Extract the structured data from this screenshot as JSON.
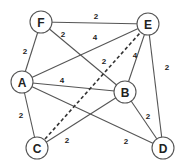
{
  "graph": {
    "nodes": [
      {
        "id": "F",
        "label": "F",
        "x": 41,
        "y": 22
      },
      {
        "id": "E",
        "label": "E",
        "x": 148,
        "y": 24
      },
      {
        "id": "A",
        "label": "A",
        "x": 22,
        "y": 82
      },
      {
        "id": "B",
        "label": "B",
        "x": 125,
        "y": 92
      },
      {
        "id": "C",
        "label": "C",
        "x": 37,
        "y": 148
      },
      {
        "id": "D",
        "label": "D",
        "x": 163,
        "y": 148
      }
    ],
    "edges": [
      {
        "from": "F",
        "to": "E",
        "weight": "2",
        "dashed": false,
        "lx": 96,
        "ly": 16
      },
      {
        "from": "F",
        "to": "A",
        "weight": "2",
        "dashed": false,
        "lx": 25,
        "ly": 51
      },
      {
        "from": "F",
        "to": "B",
        "weight": "2",
        "dashed": false,
        "lx": 63,
        "ly": 34
      },
      {
        "from": "A",
        "to": "E",
        "weight": "4",
        "dashed": false,
        "lx": 95,
        "ly": 37
      },
      {
        "from": "A",
        "to": "B",
        "weight": "4",
        "dashed": false,
        "lx": 62,
        "ly": 80
      },
      {
        "from": "A",
        "to": "C",
        "weight": "2",
        "dashed": false,
        "lx": 21,
        "ly": 115
      },
      {
        "from": "A",
        "to": "D",
        "weight": "2",
        "dashed": false,
        "lx": 126,
        "ly": 141
      },
      {
        "from": "C",
        "to": "E",
        "weight": "2",
        "dashed": true,
        "lx": 104,
        "ly": 61
      },
      {
        "from": "C",
        "to": "B",
        "weight": "2",
        "dashed": false,
        "lx": 67,
        "ly": 140
      },
      {
        "from": "B",
        "to": "E",
        "weight": "4",
        "dashed": false,
        "lx": 135,
        "ly": 55
      },
      {
        "from": "B",
        "to": "D",
        "weight": "2",
        "dashed": false,
        "lx": 148,
        "ly": 116
      },
      {
        "from": "E",
        "to": "D",
        "weight": "2",
        "dashed": false,
        "lx": 167,
        "ly": 67
      }
    ],
    "node_radius": 11,
    "colors": {
      "stroke": "#555555",
      "text": "#222222",
      "background": "#ffffff"
    }
  }
}
